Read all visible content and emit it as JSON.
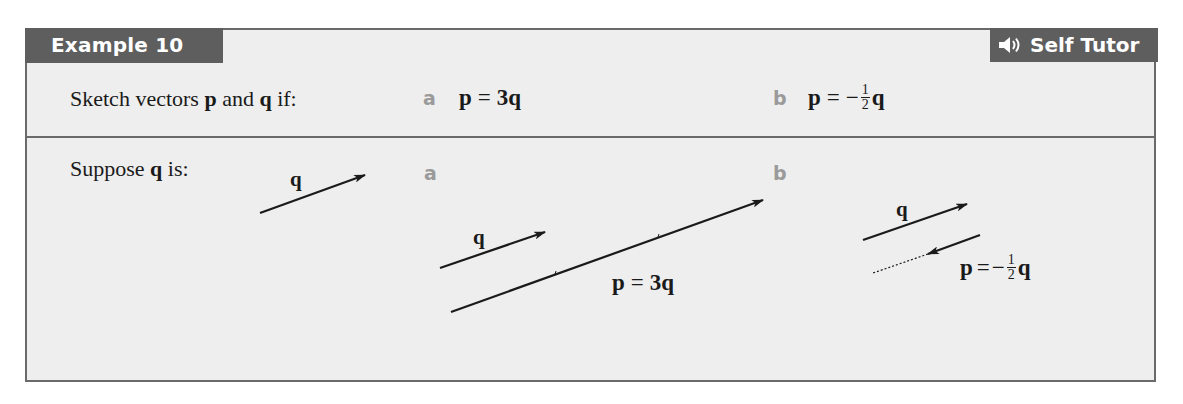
{
  "header": {
    "example_label": "Example 10",
    "tutor_label": "Self Tutor",
    "tutor_icon": "speaker-icon"
  },
  "question": {
    "prompt_prefix": "Sketch vectors ",
    "p": "p",
    "and": " and ",
    "q": "q",
    "prompt_suffix": " if:",
    "parts": [
      {
        "label": "a",
        "lhs": "p",
        "op": "=",
        "rhs": "3q"
      },
      {
        "label": "b",
        "lhs": "p",
        "op": "=",
        "rhs_sign": "−",
        "rhs_num": "1",
        "rhs_den": "2",
        "rhs_var": "q"
      }
    ]
  },
  "solution": {
    "suppose_prefix": "Suppose ",
    "suppose_var": "q",
    "suppose_suffix": " is:",
    "sample_vector_label": "q",
    "part_a": {
      "label": "a",
      "q_label": "q",
      "p_label": {
        "lhs": "p",
        "op": "=",
        "rhs": "3q"
      }
    },
    "part_b": {
      "label": "b",
      "q_label": "q",
      "p_label": {
        "lhs": "p",
        "op": "=",
        "sign": "−",
        "num": "1",
        "den": "2",
        "var": "q"
      }
    }
  },
  "colors": {
    "tab_bg": "#5e5e5e",
    "box_bg": "#eeeeee",
    "border": "#6a6a6a",
    "part_label": "#9a9a9a",
    "ink": "#1a1a1a"
  }
}
